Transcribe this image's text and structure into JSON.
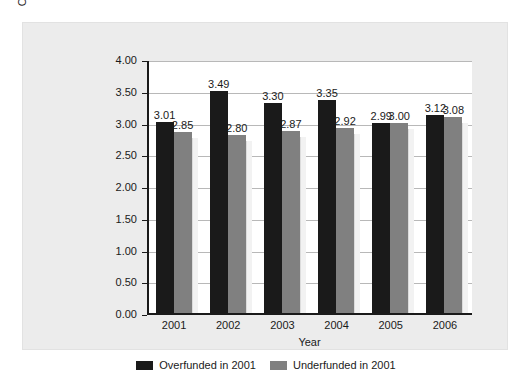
{
  "chart_data": {
    "type": "bar",
    "title": "",
    "subtitle": "",
    "xlabel": "Year",
    "ylabel": "Operating Cash Flow per Common Share",
    "categories": [
      "2001",
      "2002",
      "2003",
      "2004",
      "2005",
      "2006"
    ],
    "series": [
      {
        "name": "Overfunded in 2001",
        "color": "#1a1a1a",
        "values": [
          3.01,
          3.49,
          3.3,
          3.35,
          2.99,
          3.12
        ],
        "labels": [
          "3.01",
          "3.49",
          "3.30",
          "3.35",
          "2.99",
          "3.12"
        ]
      },
      {
        "name": "Underfunded in 2001",
        "color": "#808080",
        "values": [
          2.85,
          2.8,
          2.87,
          2.92,
          3.0,
          3.08
        ],
        "labels": [
          "2.85",
          "2.80",
          "2.87",
          "2.92",
          "3.00",
          "3.08"
        ]
      }
    ],
    "ylim": [
      0.0,
      4.0
    ],
    "ytick_labels": [
      "4.00",
      "3.50",
      "3.00",
      "2.50",
      "2.00",
      "1.50",
      "1.00",
      "0.50",
      "0.00"
    ],
    "ytick_values": [
      4.0,
      3.5,
      3.0,
      2.5,
      2.0,
      1.5,
      1.0,
      0.5,
      0.0
    ],
    "grid": true,
    "legend_position": "bottom",
    "plot_background": "#ffffff",
    "panel_background": "#ececec",
    "axis_color": "#1a1a1a",
    "gridline_color": "#b8b8b8"
  },
  "legend": {
    "entries": [
      {
        "label": "Overfunded in 2001",
        "color": "#1a1a1a"
      },
      {
        "label": "Underfunded in 2001",
        "color": "#808080"
      }
    ]
  }
}
